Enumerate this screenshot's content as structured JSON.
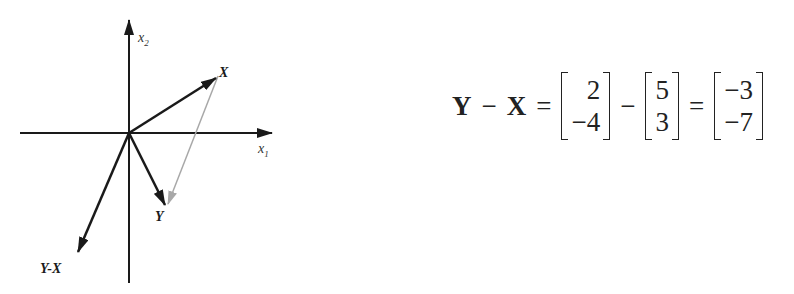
{
  "diagram": {
    "axes": {
      "x_label": "x",
      "x_sub": "1",
      "y_label": "x",
      "y_sub": "2"
    },
    "vectors": [
      {
        "name": "X",
        "label": "X",
        "components": [
          5,
          3
        ],
        "color": "#1a1a1a"
      },
      {
        "name": "Y",
        "label": "Y",
        "components": [
          2,
          -4
        ],
        "color": "#1a1a1a"
      },
      {
        "name": "Y-X",
        "label": "Y-X",
        "components": [
          -3,
          -7
        ],
        "color": "#1a1a1a"
      },
      {
        "name": "X-to-Y",
        "label": "",
        "from": "X",
        "to": "Y",
        "color": "#9a9a9a"
      }
    ]
  },
  "equation": {
    "lhs_y": "Y",
    "minus1": "−",
    "lhs_x": "X",
    "equals1": "=",
    "m1": [
      "2",
      "−4"
    ],
    "minus2": "−",
    "m2": [
      "5",
      "3"
    ],
    "equals2": "=",
    "m3": [
      "−3",
      "−7"
    ]
  }
}
